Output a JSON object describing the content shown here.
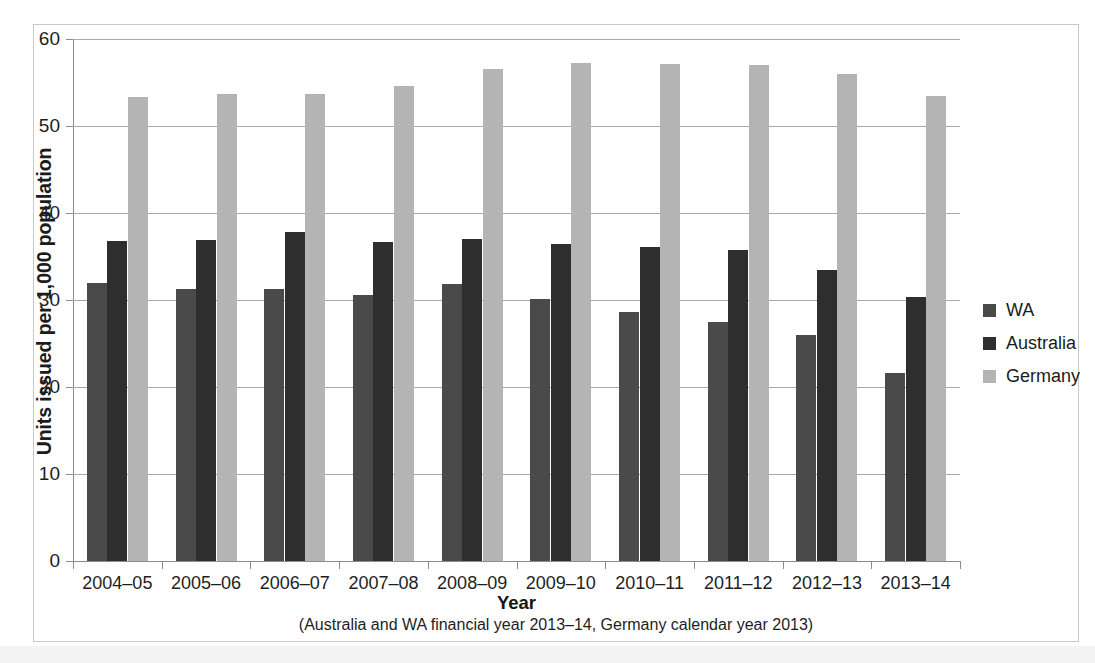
{
  "chart_data": {
    "type": "bar",
    "title": "",
    "subtitle": "",
    "xlabel": "Year",
    "xnote": "(Australia and WA financial year 2013–14, Germany calendar year 2013)",
    "ylabel": "Units issued per 1,000 population",
    "ylim": [
      0,
      60
    ],
    "yticks": [
      0,
      10,
      20,
      30,
      40,
      50,
      60
    ],
    "ytick_labels": [
      "0",
      "10",
      "20",
      "30",
      "40",
      "50",
      "60"
    ],
    "grid": true,
    "legend_position": "right",
    "categories": [
      "2004–05",
      "2005–06",
      "2006–07",
      "2007–08",
      "2008–09",
      "2009–10",
      "2010–11",
      "2011–12",
      "2012–13",
      "2013–14"
    ],
    "series": [
      {
        "name": "WA",
        "color": "#4a4a4a",
        "values": [
          31.9,
          31.3,
          31.3,
          30.6,
          31.8,
          30.1,
          28.6,
          27.5,
          26.0,
          21.6
        ]
      },
      {
        "name": "Australia",
        "color": "#2e2e2e",
        "values": [
          36.8,
          36.9,
          37.8,
          36.7,
          37.0,
          36.4,
          36.1,
          35.7,
          33.5,
          30.4
        ]
      },
      {
        "name": "Germany",
        "color": "#b4b4b4",
        "values": [
          53.3,
          53.7,
          53.7,
          54.6,
          56.6,
          57.3,
          57.1,
          57.0,
          56.0,
          53.5
        ]
      }
    ]
  },
  "legend": {
    "items": [
      {
        "label": "WA",
        "key": "wa"
      },
      {
        "label": "Australia",
        "key": "au"
      },
      {
        "label": "Germany",
        "key": "de"
      }
    ]
  },
  "page": {
    "footer_text": ""
  }
}
